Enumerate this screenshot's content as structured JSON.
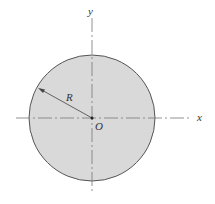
{
  "diagram": {
    "type": "circular cross-section with centroidal axes",
    "labels": {
      "x_axis": "x",
      "y_axis": "y",
      "radius": "R",
      "origin": "O"
    },
    "colors": {
      "fill": "#d9d9d9",
      "stroke": "#555555",
      "axis": "#777777"
    }
  }
}
